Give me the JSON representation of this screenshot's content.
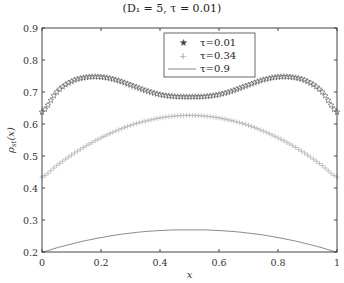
{
  "title": "(D₁ = 5, τ = 0.01)",
  "chart_data": {
    "type": "line",
    "xlabel": "x",
    "ylabel": "ρ_st(x)",
    "xlim": [
      0,
      1
    ],
    "ylim": [
      0.2,
      0.9
    ],
    "xticks": [
      "0",
      "0.2",
      "0.4",
      "0.6",
      "0.8",
      "1"
    ],
    "yticks": [
      "0.2",
      "0.3",
      "0.4",
      "0.5",
      "0.6",
      "0.7",
      "0.8",
      "0.9"
    ],
    "grid": false,
    "legend_position": "upper center",
    "x": [
      0,
      0.05,
      0.1,
      0.15,
      0.2,
      0.25,
      0.3,
      0.35,
      0.4,
      0.45,
      0.5,
      0.55,
      0.6,
      0.65,
      0.7,
      0.75,
      0.8,
      0.85,
      0.9,
      0.95,
      1.0
    ],
    "series": [
      {
        "name": "τ=0.01",
        "marker": "star",
        "color": "#555555",
        "values": [
          0.637,
          0.7,
          0.733,
          0.746,
          0.747,
          0.738,
          0.722,
          0.705,
          0.692,
          0.686,
          0.685,
          0.686,
          0.692,
          0.705,
          0.722,
          0.738,
          0.747,
          0.746,
          0.733,
          0.7,
          0.637
        ]
      },
      {
        "name": "τ=0.34",
        "marker": "plus",
        "color": "#aaaaaa",
        "values": [
          0.434,
          0.47,
          0.503,
          0.532,
          0.557,
          0.578,
          0.596,
          0.609,
          0.619,
          0.625,
          0.627,
          0.625,
          0.619,
          0.609,
          0.596,
          0.578,
          0.557,
          0.532,
          0.503,
          0.47,
          0.434
        ]
      },
      {
        "name": "τ=0.9",
        "marker": "none",
        "color": "#888888",
        "values": [
          0.2,
          0.213,
          0.225,
          0.236,
          0.245,
          0.253,
          0.259,
          0.264,
          0.267,
          0.269,
          0.269,
          0.269,
          0.267,
          0.264,
          0.259,
          0.253,
          0.245,
          0.236,
          0.225,
          0.213,
          0.2
        ]
      }
    ]
  },
  "legend": {
    "items": [
      {
        "label": "τ=0.01"
      },
      {
        "label": "τ=0.34"
      },
      {
        "label": "τ=0.9"
      }
    ]
  }
}
